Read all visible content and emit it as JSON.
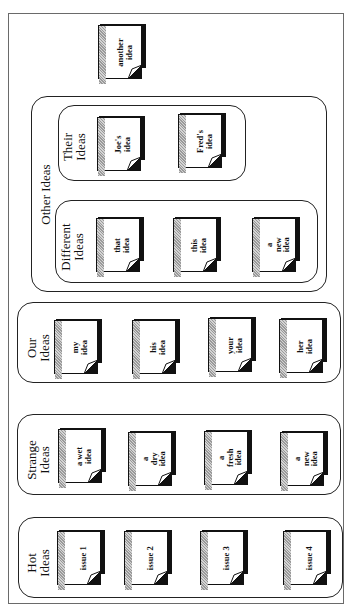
{
  "diagram": {
    "orientation": "rotated 90deg counter-clockwise",
    "standalone_item": {
      "label": "another\nidea"
    },
    "groups": {
      "other_ideas": {
        "label": "Other Ideas",
        "subgroups": {
          "their_ideas": {
            "label": "Their\nIdeas",
            "items": [
              {
                "label": "Joe's\nidea"
              },
              {
                "label": "Fred's\nidea"
              }
            ]
          },
          "different_ideas": {
            "label": "Different\nIdeas",
            "items": [
              {
                "label": "that\nidea"
              },
              {
                "label": "this\nidea"
              },
              {
                "label": "a\nnew\nidea"
              }
            ]
          }
        }
      },
      "our_ideas": {
        "label": "Our\nIdeas",
        "items": [
          {
            "label": "my\nidea"
          },
          {
            "label": "his\nidea"
          },
          {
            "label": "your\nidea"
          },
          {
            "label": "her\nidea"
          }
        ]
      },
      "strange_ideas": {
        "label": "Strange\nIdeas",
        "items": [
          {
            "label": "a wet\nidea"
          },
          {
            "label": "a\ndry\nidea"
          },
          {
            "label": "a\nfresh\nidea"
          },
          {
            "label": "a\nnew\nidea"
          }
        ]
      },
      "hot_ideas": {
        "label": "Hot\nIdeas",
        "items": [
          {
            "label": "issue 1"
          },
          {
            "label": "issue 2"
          },
          {
            "label": "issue 3"
          },
          {
            "label": "issue 4"
          }
        ]
      }
    },
    "colors": {
      "outline": "#222222",
      "frame": "#6a6a6a",
      "stripe": "#9a9a9a",
      "background": "#ffffff"
    }
  }
}
